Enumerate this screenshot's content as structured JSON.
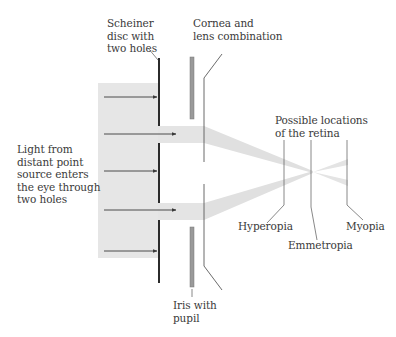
{
  "labels": {
    "scheiner_disc": "Scheiner\ndisc with\ntwo holes",
    "cornea_lens": "Cornea and\nlens combination",
    "light_source": "Light from\ndistant point\nsource enters\nthe eye through\ntwo holes",
    "retina_locations": "Possible locations\nof the retina",
    "hyperopia": "Hyperopia",
    "emmetropia": "Emmetropia",
    "myopia": "Myopia",
    "iris": "Iris with\npupil"
  },
  "colors": {
    "light_field": "#e6e6e6",
    "beam": "#e0e0e0",
    "disc": "#2b2b2b",
    "iris_bar": "#9a9a9a",
    "leader_line": "#6a6a6a",
    "arrow": "#3a3a3a"
  },
  "geometry": {
    "incoming_arrow_count": 5,
    "disc_hole_count": 2,
    "retina_positions": [
      "Hyperopia",
      "Emmetropia",
      "Myopia"
    ]
  }
}
